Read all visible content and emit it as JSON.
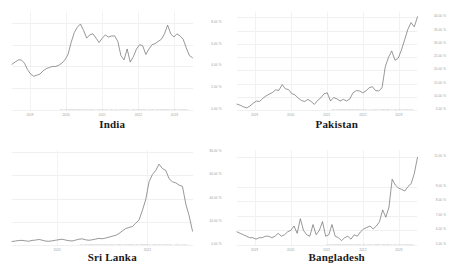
{
  "panels": [
    {
      "country": "India",
      "attribution": "TRADINGECONOMICS.COM | MINISTRY OF STATISTICS AND PROGRAMME IMPLEMENTATION (MOSPI)",
      "ylabels": [
        "8.00 %",
        "6.00 %",
        "4.00 %",
        "2.00 %",
        "0.00 %"
      ],
      "xlabels": [
        "2019",
        "2020",
        "2021",
        "2022",
        "2023"
      ]
    },
    {
      "country": "Pakistan",
      "attribution": "TRADINGECONOMICS.COM | PAKISTAN BUREAU OF STATISTICS",
      "ylabels": [
        "40.00 %",
        "35.00 %",
        "30.00 %",
        "25.00 %",
        "20.00 %",
        "15.00 %",
        "10.00 %",
        "5.00 %"
      ],
      "xlabels": [
        "2019",
        "2020",
        "2021",
        "2022",
        "2023"
      ]
    },
    {
      "country": "Sri Lanka",
      "attribution": "TRADINGECONOMICS.COM | DEPARTMENT OF CENSUS AND STATISTICS - SRI LANKA",
      "ylabels": [
        "80.00 %",
        "60.00 %",
        "40.00 %",
        "20.00 %",
        "0.00 %"
      ],
      "xlabels": [
        "2020",
        "2022"
      ]
    },
    {
      "country": "Bangladesh",
      "attribution": "TRADINGECONOMICS.COM | BANGLADESH BUREAU OF STATISTICS",
      "ylabels": [
        "11.00 %",
        "9.00 %",
        "8.00 %",
        "7.00 %",
        "6.00 %",
        "5.00 %"
      ],
      "xlabels": [
        "2019",
        "2020",
        "2021",
        "2022",
        "2023"
      ]
    }
  ],
  "chart_data": [
    {
      "type": "line",
      "title": "India",
      "xlabel": "",
      "ylabel": "Inflation Rate (%)",
      "ylim": [
        0,
        9
      ],
      "yticks": [
        0,
        2,
        4,
        6,
        8
      ],
      "ytick_labels": [
        "0.00 %",
        "2.00 %",
        "4.00 %",
        "6.00 %",
        "8.00 %"
      ],
      "xtick_labels": [
        "2019",
        "2020",
        "2021",
        "2022",
        "2023"
      ],
      "grid": true,
      "legend": "none",
      "source": "TRADINGECONOMICS.COM | MINISTRY OF STATISTICS AND PROGRAMME IMPLEMENTATION (MOSPI)",
      "x": [
        0,
        1,
        2,
        3,
        4,
        5,
        6,
        7,
        8,
        9,
        10,
        11,
        12,
        13,
        14,
        15,
        16,
        17,
        18,
        19,
        20,
        21,
        22,
        23,
        24,
        25,
        26,
        27,
        28,
        29,
        30,
        31,
        32,
        33,
        34,
        35,
        36,
        37,
        38,
        39,
        40,
        41,
        42,
        43,
        44,
        45,
        46,
        47,
        48,
        49,
        50,
        51,
        52,
        53,
        54,
        55,
        56
      ],
      "values": [
        4.2,
        4.4,
        4.6,
        4.6,
        4.3,
        3.7,
        3.3,
        3.1,
        3.2,
        3.3,
        3.6,
        3.8,
        3.9,
        4.0,
        4.0,
        4.1,
        4.3,
        4.6,
        5.1,
        6.2,
        7.1,
        7.6,
        7.9,
        7.3,
        6.6,
        6.9,
        7.0,
        6.6,
        6.2,
        6.6,
        6.9,
        6.7,
        6.8,
        6.8,
        6.3,
        5.0,
        4.6,
        5.6,
        4.4,
        4.9,
        5.6,
        6.0,
        5.9,
        5.1,
        5.6,
        6.0,
        6.1,
        6.3,
        6.5,
        7.0,
        7.8,
        7.0,
        6.7,
        7.0,
        6.8,
        6.5,
        5.7,
        5.0,
        4.8
      ]
    },
    {
      "type": "line",
      "title": "Pakistan",
      "xlabel": "",
      "ylabel": "Inflation Rate (%)",
      "ylim": [
        5,
        42
      ],
      "yticks": [
        5,
        10,
        15,
        20,
        25,
        30,
        35,
        40
      ],
      "ytick_labels": [
        "5.00 %",
        "10.00 %",
        "15.00 %",
        "20.00 %",
        "25.00 %",
        "30.00 %",
        "35.00 %",
        "40.00 %"
      ],
      "xtick_labels": [
        "2019",
        "2020",
        "2021",
        "2022",
        "2023"
      ],
      "grid": true,
      "legend": "none",
      "source": "TRADINGECONOMICS.COM | PAKISTAN BUREAU OF STATISTICS",
      "values": [
        7.2,
        6.8,
        6.2,
        5.8,
        6.5,
        7.5,
        8.4,
        8.2,
        9.4,
        10.3,
        11.0,
        11.6,
        12.6,
        12.4,
        14.6,
        13.0,
        12.7,
        11.2,
        10.7,
        9.5,
        8.6,
        8.2,
        9.0,
        8.2,
        7.1,
        8.6,
        9.6,
        11.1,
        11.5,
        8.4,
        9.7,
        9.2,
        8.4,
        9.0,
        8.4,
        9.2,
        11.5,
        12.3,
        12.2,
        11.5,
        12.2,
        13.4,
        13.8,
        12.3,
        12.2,
        13.4,
        21.3,
        24.9,
        27.3,
        23.8,
        24.5,
        27.6,
        31.5,
        35.4,
        38.0,
        36.4,
        40.2
      ]
    },
    {
      "type": "line",
      "title": "Sri Lanka",
      "xlabel": "",
      "ylabel": "Inflation Rate (%)",
      "ylim": [
        0,
        82
      ],
      "yticks": [
        0,
        20,
        40,
        60,
        80
      ],
      "ytick_labels": [
        "0.00 %",
        "20.00 %",
        "40.00 %",
        "60.00 %",
        "80.00 %"
      ],
      "xtick_labels": [
        "2020",
        "2022"
      ],
      "grid": true,
      "legend": "none",
      "source": "TRADINGECONOMICS.COM | DEPARTMENT OF CENSUS AND STATISTICS - SRI LANKA",
      "values": [
        3.0,
        3.4,
        3.9,
        4.0,
        3.6,
        3.2,
        4.0,
        4.2,
        4.8,
        4.2,
        3.4,
        3.2,
        3.6,
        4.1,
        4.6,
        5.0,
        4.3,
        3.7,
        3.5,
        4.2,
        5.0,
        5.3,
        4.5,
        4.1,
        4.5,
        5.1,
        5.7,
        5.4,
        6.0,
        6.8,
        7.6,
        8.3,
        9.9,
        12.1,
        14.2,
        15.1,
        16.0,
        18.7,
        21.5,
        29.8,
        39.1,
        54.6,
        60.8,
        64.3,
        69.8,
        66.0,
        64.4,
        57.2,
        54.6,
        53.6,
        51.7,
        50.6,
        35.3,
        25.2,
        12.0
      ]
    },
    {
      "type": "line",
      "title": "Bangladesh",
      "xlabel": "",
      "ylabel": "Inflation Rate (%)",
      "ylim": [
        5,
        11.5
      ],
      "yticks": [
        5,
        6,
        7,
        8,
        9,
        11
      ],
      "ytick_labels": [
        "5.00 %",
        "6.00 %",
        "7.00 %",
        "8.00 %",
        "9.00 %",
        "11.00 %"
      ],
      "xtick_labels": [
        "2019",
        "2020",
        "2021",
        "2022",
        "2023"
      ],
      "grid": true,
      "legend": "none",
      "source": "TRADINGECONOMICS.COM | BANGLADESH BUREAU OF STATISTICS",
      "values": [
        5.9,
        5.8,
        5.7,
        5.6,
        5.5,
        5.5,
        5.4,
        5.5,
        5.5,
        5.6,
        5.6,
        5.5,
        5.6,
        5.8,
        5.6,
        5.7,
        5.9,
        6.0,
        6.3,
        5.8,
        6.8,
        6.0,
        5.7,
        5.6,
        6.4,
        5.7,
        6.0,
        6.6,
        5.6,
        5.7,
        6.4,
        5.6,
        5.5,
        5.3,
        5.5,
        5.6,
        5.4,
        5.7,
        5.6,
        5.9,
        6.1,
        6.2,
        6.3,
        6.1,
        6.3,
        6.6,
        7.4,
        6.9,
        7.6,
        9.5,
        9.1,
        8.9,
        8.8,
        8.7,
        9.0,
        9.2,
        9.9,
        11.0
      ]
    }
  ]
}
